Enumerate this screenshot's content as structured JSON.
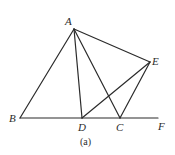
{
  "figure": {
    "caption": "(a)",
    "points": {
      "A": {
        "label": "A",
        "x": 74,
        "y": 29
      },
      "B": {
        "label": "B",
        "x": 20,
        "y": 118
      },
      "D": {
        "label": "D",
        "x": 82,
        "y": 118
      },
      "C": {
        "label": "C",
        "x": 120,
        "y": 118
      },
      "E": {
        "label": "E",
        "x": 150,
        "y": 62
      },
      "F": {
        "label": "F",
        "x": 158,
        "y": 118
      }
    },
    "segments": [
      [
        "A",
        "B"
      ],
      [
        "A",
        "D"
      ],
      [
        "A",
        "C"
      ],
      [
        "A",
        "E"
      ],
      [
        "B",
        "F"
      ],
      [
        "D",
        "E"
      ],
      [
        "C",
        "E"
      ]
    ]
  }
}
